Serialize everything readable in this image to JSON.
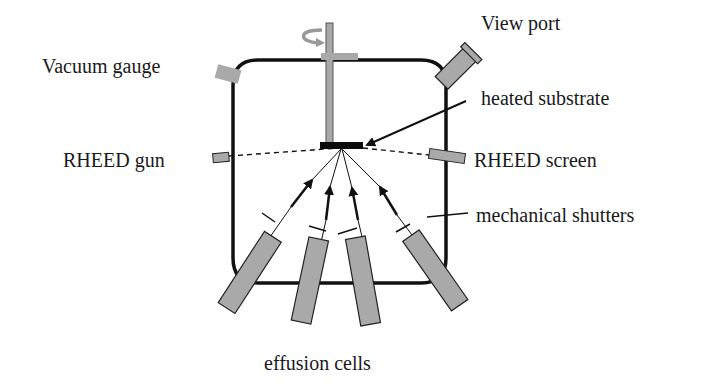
{
  "diagram": {
    "labels": {
      "vacuum_gauge": "Vacuum gauge",
      "view_port": "View port",
      "heated_substrate": "heated substrate",
      "rheed_gun": "RHEED gun",
      "rheed_screen": "RHEED screen",
      "mechanical_shutters": "mechanical shutters",
      "effusion_cells": "effusion cells"
    },
    "components": [
      "chamber",
      "rotating-manipulator-rod",
      "substrate",
      "vacuum-gauge",
      "view-port",
      "rheed-gun",
      "rheed-screen",
      "effusion-cell-1",
      "effusion-cell-2",
      "effusion-cell-3",
      "effusion-cell-4",
      "shutters"
    ],
    "icons": {
      "rotation": "rotation-arrow-icon"
    },
    "colors": {
      "component_fill": "#a9a9a9",
      "outline": "#111111",
      "substrate": "#0a0a0a",
      "background": "#ffffff"
    }
  }
}
